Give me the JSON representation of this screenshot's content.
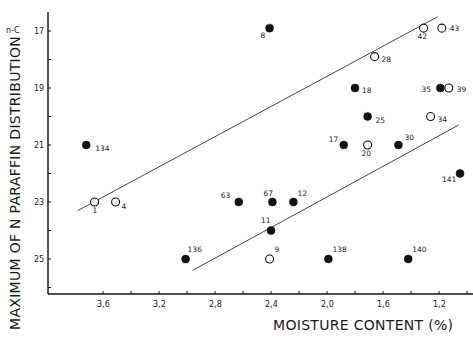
{
  "chart_data": {
    "type": "scatter",
    "title": "",
    "xlabel": "MOISTURE CONTENT (%)",
    "ylabel": "MAXIMUM OF N PARAFFIN DISTRIBUTION",
    "y_unit_label": "n-C",
    "xlim": [
      3.9,
      1.1
    ],
    "ylim": [
      17,
      26.2
    ],
    "x_inverted": true,
    "y_inverted": true,
    "grid": false,
    "legend": null,
    "x_ticks": [
      "3,6",
      "3,2",
      "2,8",
      "2,4",
      "2,0",
      "1,6",
      "1,2"
    ],
    "x_tick_values": [
      3.6,
      3.2,
      2.8,
      2.4,
      2.0,
      1.6,
      1.2
    ],
    "y_ticks": [
      "17",
      "19",
      "21",
      "23",
      "25"
    ],
    "y_tick_values": [
      17,
      19,
      21,
      23,
      25
    ],
    "series": [
      {
        "name": "filled",
        "marker": "filled-circle",
        "points": [
          {
            "label": "8",
            "x": 2.41,
            "y": 16.9
          },
          {
            "label": "18",
            "x": 1.8,
            "y": 19.0
          },
          {
            "label": "35",
            "x": 1.19,
            "y": 19.0
          },
          {
            "label": "25",
            "x": 1.71,
            "y": 20.0
          },
          {
            "label": "17",
            "x": 1.88,
            "y": 21.0
          },
          {
            "label": "30",
            "x": 1.49,
            "y": 21.0
          },
          {
            "label": "134",
            "x": 3.72,
            "y": 21.0
          },
          {
            "label": "141",
            "x": 1.05,
            "y": 22.0
          },
          {
            "label": "63",
            "x": 2.63,
            "y": 23.0
          },
          {
            "label": "67",
            "x": 2.39,
            "y": 23.0
          },
          {
            "label": "12",
            "x": 2.24,
            "y": 23.0
          },
          {
            "label": "11",
            "x": 2.4,
            "y": 24.0
          },
          {
            "label": "136",
            "x": 3.01,
            "y": 25.0
          },
          {
            "label": "138",
            "x": 1.99,
            "y": 25.0
          },
          {
            "label": "140",
            "x": 1.42,
            "y": 25.0
          }
        ]
      },
      {
        "name": "open",
        "marker": "open-circle",
        "points": [
          {
            "label": "42",
            "x": 1.31,
            "y": 16.9
          },
          {
            "label": "43",
            "x": 1.18,
            "y": 16.9
          },
          {
            "label": "28",
            "x": 1.66,
            "y": 17.9
          },
          {
            "label": "39",
            "x": 1.13,
            "y": 19.0
          },
          {
            "label": "34",
            "x": 1.26,
            "y": 20.0
          },
          {
            "label": "20",
            "x": 1.71,
            "y": 21.0
          },
          {
            "label": "1",
            "x": 3.66,
            "y": 23.0
          },
          {
            "label": "4",
            "x": 3.51,
            "y": 23.0
          },
          {
            "label": "9",
            "x": 2.41,
            "y": 25.0
          }
        ]
      }
    ],
    "lines": [
      {
        "name": "upper-boundary",
        "from": {
          "x": 3.78,
          "y": 23.3
        },
        "to": {
          "x": 1.21,
          "y": 16.5
        }
      },
      {
        "name": "lower-boundary",
        "from": {
          "x": 2.96,
          "y": 25.4
        },
        "to": {
          "x": 1.06,
          "y": 20.3
        }
      }
    ]
  },
  "layout": {
    "plot": {
      "x0": 48,
      "x1": 473,
      "y_top": 12,
      "y_bottom": 294
    },
    "x_px": {
      "ref_value": 3.6,
      "ref_px": 103,
      "px_per_unit": 140
    },
    "y_px": {
      "ref_value": 17,
      "ref_px": 31,
      "px_per_unit": 28.5
    },
    "label_offsets": {
      "8": [
        -9,
        10
      ],
      "42": [
        -6,
        11
      ],
      "43": [
        8,
        3
      ],
      "28": [
        7,
        5
      ],
      "18": [
        7,
        5
      ],
      "35": [
        -19,
        4
      ],
      "39": [
        8,
        4
      ],
      "25": [
        8,
        6
      ],
      "34": [
        7,
        5
      ],
      "17": [
        -15,
        -3
      ],
      "20": [
        -6,
        11
      ],
      "30": [
        6,
        -5
      ],
      "134": [
        9,
        6
      ],
      "141": [
        -18,
        8
      ],
      "63": [
        -18,
        -4
      ],
      "67": [
        -9,
        -6
      ],
      "12": [
        4,
        -6
      ],
      "11": [
        -10,
        -8
      ],
      "136": [
        2,
        -7
      ],
      "9": [
        5,
        -7
      ],
      "138": [
        4,
        -7
      ],
      "140": [
        4,
        -7
      ],
      "1": [
        -2,
        11
      ],
      "4": [
        6,
        7
      ]
    }
  }
}
